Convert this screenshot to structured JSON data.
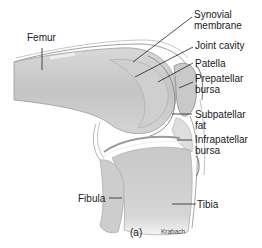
{
  "figure": {
    "panel_label": "(a)",
    "credit": "Krabach",
    "labels": {
      "femur": "Femur",
      "synovial_membrane_1": "Synovial",
      "synovial_membrane_2": "membrane",
      "joint_cavity": "Joint cavity",
      "patella": "Patella",
      "prepatellar_bursa_1": "Prepatellar",
      "prepatellar_bursa_2": "bursa",
      "subpatellar_fat_1": "Subpatellar",
      "subpatellar_fat_2": "fat",
      "infrapatellar_bursa_1": "Infrapatellar",
      "infrapatellar_bursa_2": "bursa",
      "fibula": "Fibula",
      "tibia": "Tibia"
    }
  }
}
